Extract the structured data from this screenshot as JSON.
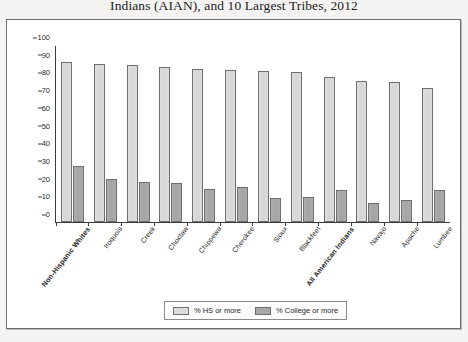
{
  "title": "Indians (AIAN), and 10 Largest Tribes, 2012",
  "legend": {
    "hs_label": "% HS or more",
    "college_label": "% College or more",
    "hs_color": "#dcdcdc",
    "college_color": "#a8a8a8"
  },
  "chart_data": {
    "type": "bar",
    "title": "Indians (AIAN), and 10 Largest Tribes, 2012",
    "xlabel": "",
    "ylabel": "",
    "ylim": [
      0,
      100
    ],
    "yticks": [
      0,
      10,
      20,
      30,
      40,
      50,
      60,
      70,
      80,
      90,
      100
    ],
    "grid": false,
    "legend_position": "bottom",
    "categories": [
      "Non-Hispanic Whites",
      "Iroquois",
      "Creek",
      "Choctaw",
      "Chippewa",
      "Cherokee",
      "Sioux",
      "Blackfeet",
      "All American Indians",
      "Navajo",
      "Apache",
      "Lumbee"
    ],
    "bold_categories": [
      "Non-Hispanic Whites",
      "All American Indians"
    ],
    "series": [
      {
        "name": "% HS or more",
        "color": "#dcdcdc",
        "values": [
          91,
          90,
          89,
          88,
          87,
          86.5,
          86,
          85,
          82.5,
          80,
          79.5,
          76
        ]
      },
      {
        "name": "% College or more",
        "color": "#a8a8a8",
        "values": [
          32,
          24.5,
          23,
          22,
          18.5,
          20,
          13.5,
          14,
          18,
          11,
          12.5,
          18
        ]
      }
    ]
  }
}
